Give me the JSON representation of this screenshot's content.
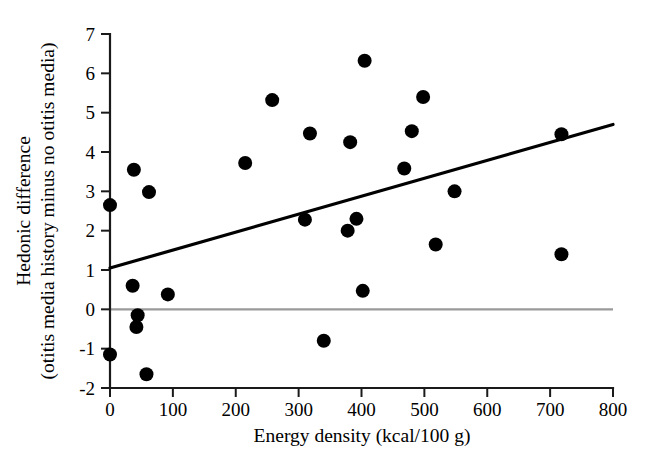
{
  "chart_data": {
    "type": "scatter",
    "title": "",
    "xlabel": "Energy density (kcal/100 g)",
    "ylabel_line1": "Hedonic difference",
    "ylabel_line2": "(otitis media history minus no otitis media)",
    "xlim": [
      0,
      800
    ],
    "ylim": [
      -2,
      7
    ],
    "xticks": [
      0,
      100,
      200,
      300,
      400,
      500,
      600,
      700,
      800
    ],
    "yticks": [
      -2,
      -1,
      0,
      1,
      2,
      3,
      4,
      5,
      6,
      7
    ],
    "xtick_labels": [
      "0",
      "100",
      "200",
      "300",
      "400",
      "500",
      "600",
      "700",
      "800"
    ],
    "ytick_labels": [
      "-2",
      "-1",
      "0",
      "1",
      "2",
      "3",
      "4",
      "5",
      "6",
      "7"
    ],
    "grid": false,
    "legend": false,
    "points": [
      {
        "x": 0,
        "y": 2.65
      },
      {
        "x": 0,
        "y": -1.15
      },
      {
        "x": 38,
        "y": 3.55
      },
      {
        "x": 36,
        "y": 0.6
      },
      {
        "x": 44,
        "y": -0.15
      },
      {
        "x": 42,
        "y": -0.45
      },
      {
        "x": 62,
        "y": 2.98
      },
      {
        "x": 58,
        "y": -1.65
      },
      {
        "x": 92,
        "y": 0.38
      },
      {
        "x": 215,
        "y": 3.72
      },
      {
        "x": 258,
        "y": 5.32
      },
      {
        "x": 310,
        "y": 2.28
      },
      {
        "x": 318,
        "y": 4.47
      },
      {
        "x": 340,
        "y": -0.8
      },
      {
        "x": 378,
        "y": 2.0
      },
      {
        "x": 382,
        "y": 4.25
      },
      {
        "x": 392,
        "y": 2.3
      },
      {
        "x": 405,
        "y": 6.32
      },
      {
        "x": 402,
        "y": 0.47
      },
      {
        "x": 468,
        "y": 3.58
      },
      {
        "x": 480,
        "y": 4.53
      },
      {
        "x": 498,
        "y": 5.4
      },
      {
        "x": 518,
        "y": 1.65
      },
      {
        "x": 548,
        "y": 3.0
      },
      {
        "x": 718,
        "y": 4.45
      },
      {
        "x": 718,
        "y": 1.4
      }
    ],
    "regression_line": {
      "x0": 0,
      "y0": 1.05,
      "x1": 800,
      "y1": 4.7,
      "label": "regression-line"
    },
    "reference_line": {
      "y": 0,
      "color": "#9a9a9a",
      "label": "zero-reference-line"
    },
    "marker": {
      "shape": "circle",
      "radius_px": 7,
      "color": "#000000"
    },
    "colors": {
      "axis": "#1a1a1a",
      "point": "#000000",
      "fit": "#000000",
      "reference": "#9a9a9a",
      "background": "#ffffff"
    }
  }
}
